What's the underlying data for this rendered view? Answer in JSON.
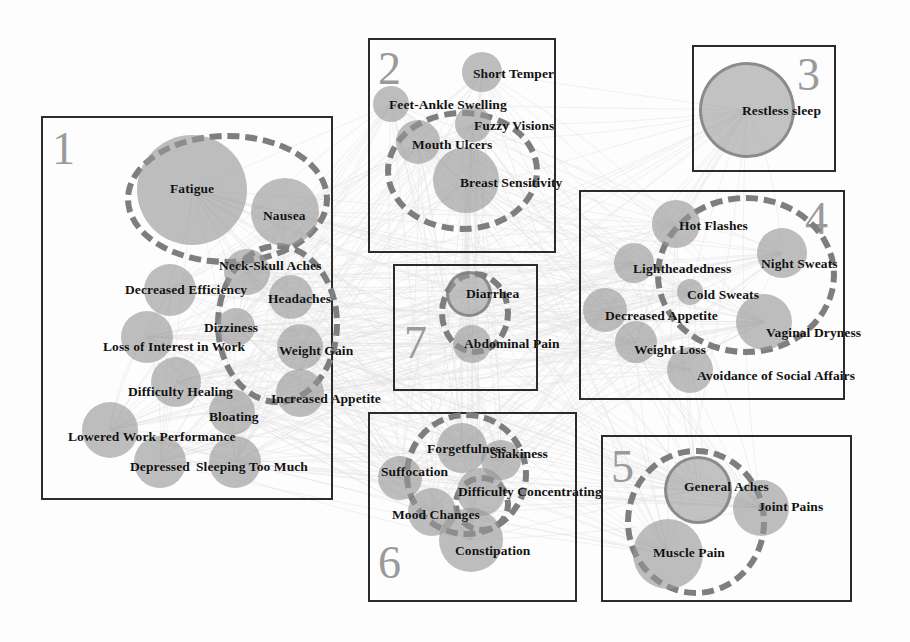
{
  "figure": {
    "type": "network-cluster-diagram",
    "background_color": "#fdfdfd",
    "node_color": "#969696",
    "box_border_color": "#2b2b2b",
    "dashed_ellipse_color": "#7e7e7e",
    "cluster_number_color": "#9a9a9a"
  },
  "clusters": [
    {
      "number": "1",
      "box": {
        "x": 41,
        "y": 116,
        "w": 292,
        "h": 384
      },
      "number_pos": {
        "x": 52,
        "y": 126
      },
      "dashed_ellipses": [
        {
          "x": 125,
          "y": 133,
          "w": 205,
          "h": 132
        },
        {
          "x": 215,
          "y": 243,
          "w": 125,
          "h": 162
        }
      ],
      "nodes": [
        {
          "label": "Fatigue",
          "cx": 192,
          "cy": 190,
          "r": 55,
          "lx": 170,
          "ly": 190,
          "anchor": "start"
        },
        {
          "label": "Nausea",
          "cx": 285,
          "cy": 212,
          "r": 34,
          "lx": 263,
          "ly": 217,
          "anchor": "start"
        },
        {
          "label": "Neck-Skull Aches",
          "cx": 247,
          "cy": 272,
          "r": 23,
          "lx": 219,
          "ly": 267,
          "anchor": "start"
        },
        {
          "label": "Decreased Efficiency",
          "cx": 170,
          "cy": 290,
          "r": 26,
          "lx": 125,
          "ly": 291,
          "anchor": "start"
        },
        {
          "label": "Headaches",
          "cx": 291,
          "cy": 297,
          "r": 22,
          "lx": 268,
          "ly": 300,
          "anchor": "start"
        },
        {
          "label": "Dizziness",
          "cx": 236,
          "cy": 327,
          "r": 19,
          "lx": 204,
          "ly": 329,
          "anchor": "start"
        },
        {
          "label": "Loss of Interest in Work",
          "cx": 147,
          "cy": 337,
          "r": 26,
          "lx": 103,
          "ly": 348,
          "anchor": "start"
        },
        {
          "label": "Weight Gain",
          "cx": 300,
          "cy": 347,
          "r": 23,
          "lx": 279,
          "ly": 352,
          "anchor": "start"
        },
        {
          "label": "Difficulty Healing",
          "cx": 176,
          "cy": 382,
          "r": 25,
          "lx": 128,
          "ly": 393,
          "anchor": "start"
        },
        {
          "label": "Increased Appetite",
          "cx": 300,
          "cy": 393,
          "r": 24,
          "lx": 271,
          "ly": 400,
          "anchor": "start"
        },
        {
          "label": "Bloating",
          "cx": 232,
          "cy": 412,
          "r": 23,
          "lx": 209,
          "ly": 418,
          "anchor": "start"
        },
        {
          "label": "Lowered Work Performance",
          "cx": 110,
          "cy": 430,
          "r": 28,
          "lx": 68,
          "ly": 438,
          "anchor": "start"
        },
        {
          "label": "Depressed",
          "cx": 160,
          "cy": 462,
          "r": 26,
          "lx": 130,
          "ly": 468,
          "anchor": "start"
        },
        {
          "label": "Sleeping Too Much",
          "cx": 235,
          "cy": 462,
          "r": 26,
          "lx": 196,
          "ly": 468,
          "anchor": "start"
        }
      ]
    },
    {
      "number": "2",
      "box": {
        "x": 368,
        "y": 38,
        "w": 188,
        "h": 215
      },
      "number_pos": {
        "x": 378,
        "y": 46
      },
      "dashed_ellipses": [
        {
          "x": 385,
          "y": 110,
          "w": 155,
          "h": 122
        }
      ],
      "nodes": [
        {
          "label": "Short Temper",
          "cx": 482,
          "cy": 72,
          "r": 20,
          "lx": 473,
          "ly": 75,
          "anchor": "start"
        },
        {
          "label": "Feet-Ankle Swelling",
          "cx": 391,
          "cy": 104,
          "r": 18,
          "lx": 389,
          "ly": 106,
          "anchor": "start"
        },
        {
          "label": "Fuzzy Visions",
          "cx": 473,
          "cy": 124,
          "r": 18,
          "lx": 474,
          "ly": 127,
          "anchor": "start"
        },
        {
          "label": "Mouth Ulcers",
          "cx": 418,
          "cy": 142,
          "r": 22,
          "lx": 412,
          "ly": 146,
          "anchor": "start"
        },
        {
          "label": "Breast Sensitivity",
          "cx": 466,
          "cy": 180,
          "r": 33,
          "lx": 460,
          "ly": 184,
          "anchor": "start"
        }
      ]
    },
    {
      "number": "3",
      "box": {
        "x": 692,
        "y": 45,
        "w": 144,
        "h": 127
      },
      "number_pos": {
        "x": 797,
        "y": 52
      },
      "dashed_ellipses": [],
      "nodes": [
        {
          "label": "Restless sleep",
          "cx": 747,
          "cy": 110,
          "r": 48,
          "ringed": true,
          "lx": 742,
          "ly": 112,
          "anchor": "start"
        }
      ]
    },
    {
      "number": "4",
      "box": {
        "x": 579,
        "y": 190,
        "w": 266,
        "h": 210
      },
      "number_pos": {
        "x": 805,
        "y": 196
      },
      "dashed_ellipses": [
        {
          "x": 655,
          "y": 195,
          "w": 182,
          "h": 160
        }
      ],
      "nodes": [
        {
          "label": "Hot Flashes",
          "cx": 676,
          "cy": 224,
          "r": 24,
          "lx": 679,
          "ly": 227,
          "anchor": "start"
        },
        {
          "label": "Night Sweats",
          "cx": 782,
          "cy": 253,
          "r": 25,
          "lx": 761,
          "ly": 265,
          "anchor": "start"
        },
        {
          "label": "Lightheadedness",
          "cx": 634,
          "cy": 263,
          "r": 20,
          "lx": 633,
          "ly": 270,
          "anchor": "start"
        },
        {
          "label": "Cold Sweats",
          "cx": 690,
          "cy": 292,
          "r": 13,
          "lx": 687,
          "ly": 296,
          "anchor": "start"
        },
        {
          "label": "Decreased Appetite",
          "cx": 605,
          "cy": 310,
          "r": 22,
          "lx": 605,
          "ly": 317,
          "anchor": "start"
        },
        {
          "label": "Vaginal Dryness",
          "cx": 764,
          "cy": 322,
          "r": 28,
          "lx": 766,
          "ly": 334,
          "anchor": "start"
        },
        {
          "label": "Weight Loss",
          "cx": 636,
          "cy": 342,
          "r": 21,
          "lx": 634,
          "ly": 351,
          "anchor": "start"
        },
        {
          "label": "Avoidance of Social Affairs",
          "cx": 690,
          "cy": 370,
          "r": 23,
          "lx": 697,
          "ly": 377,
          "anchor": "start"
        }
      ]
    },
    {
      "number": "5",
      "box": {
        "x": 601,
        "y": 435,
        "w": 251,
        "h": 167
      },
      "number_pos": {
        "x": 611,
        "y": 444
      },
      "dashed_ellipses": [
        {
          "x": 625,
          "y": 448,
          "w": 142,
          "h": 148
        }
      ],
      "nodes": [
        {
          "label": "General Aches",
          "cx": 698,
          "cy": 490,
          "r": 34,
          "ringed": true,
          "lx": 684,
          "ly": 488,
          "anchor": "start"
        },
        {
          "label": "Joint Pains",
          "cx": 761,
          "cy": 508,
          "r": 28,
          "lx": 758,
          "ly": 508,
          "anchor": "start"
        },
        {
          "label": "Muscle Pain",
          "cx": 668,
          "cy": 554,
          "r": 35,
          "lx": 653,
          "ly": 554,
          "anchor": "start"
        }
      ]
    },
    {
      "number": "6",
      "box": {
        "x": 368,
        "y": 412,
        "w": 209,
        "h": 190
      },
      "number_pos": {
        "x": 378,
        "y": 540
      },
      "dashed_ellipses": [
        {
          "x": 404,
          "y": 412,
          "w": 125,
          "h": 125
        },
        {
          "x": 453,
          "y": 475,
          "w": 58,
          "h": 58
        }
      ],
      "nodes": [
        {
          "label": "Forgetfulness",
          "cx": 462,
          "cy": 448,
          "r": 25,
          "lx": 427,
          "ly": 450,
          "anchor": "start"
        },
        {
          "label": "Shakiness",
          "cx": 501,
          "cy": 460,
          "r": 20,
          "lx": 490,
          "ly": 455,
          "anchor": "start"
        },
        {
          "label": "Suffocation",
          "cx": 400,
          "cy": 478,
          "r": 22,
          "lx": 381,
          "ly": 473,
          "anchor": "start"
        },
        {
          "label": "Difficulty Concentrating",
          "cx": 481,
          "cy": 492,
          "r": 24,
          "lx": 458,
          "ly": 493,
          "anchor": "start"
        },
        {
          "label": "Mood Changes",
          "cx": 432,
          "cy": 512,
          "r": 24,
          "lx": 392,
          "ly": 516,
          "anchor": "start"
        },
        {
          "label": "Constipation",
          "cx": 471,
          "cy": 540,
          "r": 32,
          "lx": 455,
          "ly": 552,
          "anchor": "start"
        }
      ]
    },
    {
      "number": "7",
      "box": {
        "x": 393,
        "y": 264,
        "w": 145,
        "h": 127
      },
      "number_pos": {
        "x": 404,
        "y": 320
      },
      "dashed_ellipses": [
        {
          "x": 439,
          "y": 271,
          "w": 72,
          "h": 84
        }
      ],
      "nodes": [
        {
          "label": "Diarrhea",
          "cx": 469,
          "cy": 294,
          "r": 23,
          "ringed": true,
          "lx": 466,
          "ly": 295,
          "anchor": "start"
        },
        {
          "label": "Abdominal Pain",
          "cx": 472,
          "cy": 344,
          "r": 19,
          "lx": 464,
          "ly": 345,
          "anchor": "start"
        }
      ]
    }
  ]
}
